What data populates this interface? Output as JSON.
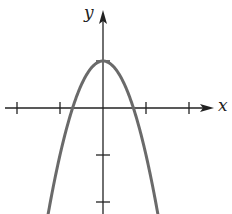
{
  "chart_data": {
    "type": "line",
    "title": "",
    "xlabel": "x",
    "ylabel": "y",
    "function": "y = 1 - 2x^2",
    "series": [
      {
        "name": "parabola",
        "color": "#6a6a6a",
        "x": [
          -1.25,
          -1.0,
          -0.75,
          -0.5,
          -0.25,
          0,
          0.25,
          0.5,
          0.75,
          1.0,
          1.25
        ],
        "y": [
          -2.125,
          -1.0,
          -0.125,
          0.5,
          0.875,
          1.0,
          0.875,
          0.5,
          -0.125,
          -1.0,
          -2.125
        ]
      }
    ],
    "x_ticks": [
      -2,
      -1,
      1,
      2
    ],
    "y_ticks": [
      1,
      -1,
      -2
    ],
    "xlim": [
      -2.4,
      2.6
    ],
    "ylim": [
      -2.3,
      2.1
    ],
    "grid": false,
    "legend": null,
    "x_intercepts": [
      -0.707,
      0.707
    ],
    "vertex": [
      0,
      1
    ]
  },
  "axes": {
    "x_label": "x",
    "y_label": "y",
    "axis_color": "#222222",
    "curve_color": "#6a6a6a"
  },
  "layout": {
    "origin_px": [
      103,
      108
    ],
    "x_unit_px": 43,
    "y_unit_px": 47
  }
}
